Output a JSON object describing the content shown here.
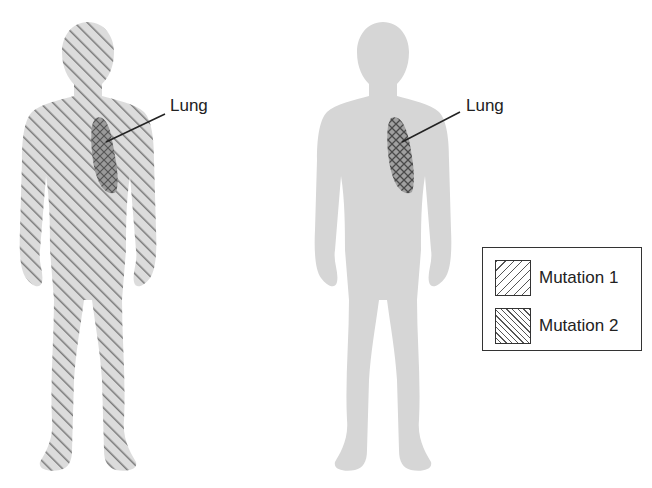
{
  "figures": [
    {
      "id": "left",
      "label": "Lung",
      "body_fill": "mutation-1-hatched",
      "organ_fill": "mutation-1-and-2-crosshatch"
    },
    {
      "id": "right",
      "label": "Lung",
      "body_fill": "plain-gray",
      "organ_fill": "mutation-2-crosshatch"
    }
  ],
  "legend": {
    "items": [
      {
        "label": "Mutation 1",
        "pattern": "diagonal-forward"
      },
      {
        "label": "Mutation 2",
        "pattern": "diagonal-backward"
      }
    ]
  },
  "colors": {
    "body_gray": "#d9d9d9",
    "hatch": "#777777",
    "lung": "#8a8a8a",
    "text": "#222222"
  }
}
